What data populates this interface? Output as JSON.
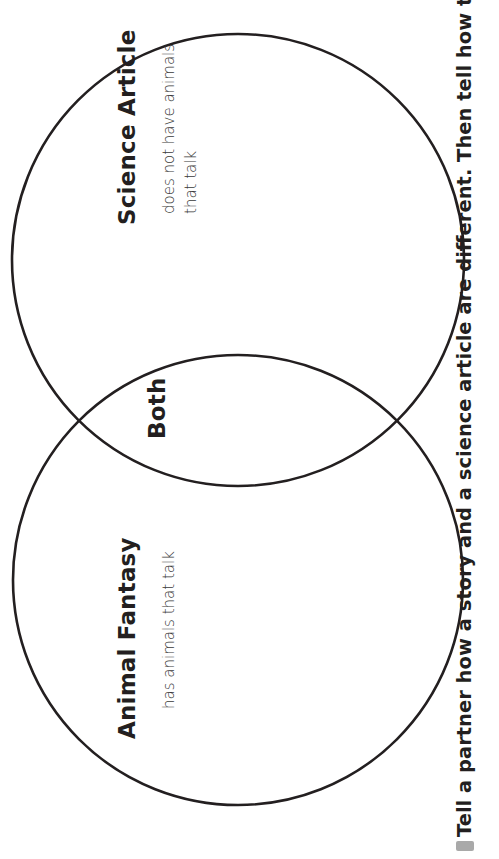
{
  "diagram": {
    "type": "venn",
    "stroke_color": "#231f20",
    "left_circle": {
      "title": "Animal Fantasy",
      "notes": [
        "has animals that talk"
      ]
    },
    "overlap": {
      "title": "Both",
      "notes": []
    },
    "right_circle": {
      "title": "Science Article",
      "notes": [
        "does not have animals",
        "that talk"
      ]
    }
  },
  "prompt": {
    "bullet_color": "#a9a9a9",
    "text": "Tell a partner how a story and a science article are different. Then tell how they are"
  }
}
